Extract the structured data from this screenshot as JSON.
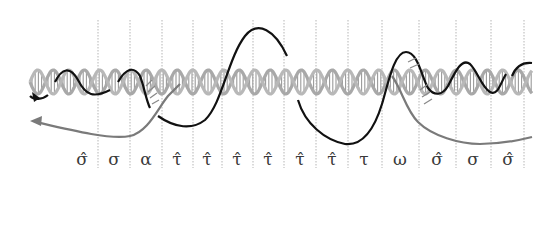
{
  "figure": {
    "colors": {
      "helix_gray": "#a8a8a8",
      "strand_black": "#111111",
      "strand_gray": "#7a7a7a",
      "divider": "#b5b5b5",
      "label": "#3a3a3a"
    },
    "dividers_x": [
      98,
      130,
      162,
      193,
      222,
      253,
      284,
      316,
      348,
      382,
      419,
      456,
      491,
      524
    ],
    "labels": [
      {
        "text": "σ̂",
        "x": 82
      },
      {
        "text": "σ",
        "x": 114
      },
      {
        "text": "α",
        "x": 146
      },
      {
        "text": "τ̂",
        "x": 177
      },
      {
        "text": "τ̂",
        "x": 207
      },
      {
        "text": "τ̂",
        "x": 237
      },
      {
        "text": "τ̂",
        "x": 268
      },
      {
        "text": "τ̂",
        "x": 300
      },
      {
        "text": "τ̂",
        "x": 332
      },
      {
        "text": "τ",
        "x": 364
      },
      {
        "text": "ω",
        "x": 400
      },
      {
        "text": "σ̂",
        "x": 437
      },
      {
        "text": "σ",
        "x": 473
      },
      {
        "text": "σ̂",
        "x": 508
      }
    ]
  }
}
